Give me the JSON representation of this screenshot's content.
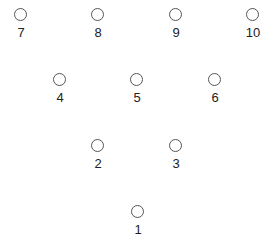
{
  "diagram": {
    "title": "",
    "pins": [
      {
        "label": "7",
        "x": 21,
        "y": 16
      },
      {
        "label": "8",
        "x": 98,
        "y": 16
      },
      {
        "label": "9",
        "x": 176,
        "y": 16
      },
      {
        "label": "10",
        "x": 253,
        "y": 16
      },
      {
        "label": "4",
        "x": 60,
        "y": 81
      },
      {
        "label": "5",
        "x": 137,
        "y": 81
      },
      {
        "label": "6",
        "x": 215,
        "y": 81
      },
      {
        "label": "2",
        "x": 98,
        "y": 147
      },
      {
        "label": "3",
        "x": 176,
        "y": 147
      },
      {
        "label": "1",
        "x": 138,
        "y": 213
      }
    ]
  }
}
